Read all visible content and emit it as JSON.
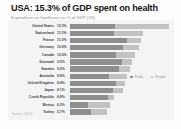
{
  "header": {
    "title": "USA: 15.3% of GDP spent on health",
    "subtitle": "Expenditure on healthcare as % of GDP ('06)"
  },
  "source": "Source: OECD",
  "legend": {
    "public_label": "Public",
    "private_label": "Private",
    "public_color": "#8e8e8e",
    "private_color": "#c2c2c2"
  },
  "chart_data": {
    "type": "bar",
    "title": "USA: 15.3% of GDP spent on health",
    "subtitle": "Expenditure on healthcare as % of GDP ('06)",
    "xlabel": "",
    "ylabel": "",
    "orientation": "horizontal",
    "stacked": true,
    "grid": false,
    "legend_position": "center-right",
    "xlim": [
      0,
      16
    ],
    "categories": [
      "United States",
      "Switzerland",
      "France",
      "Germany",
      "Canada",
      "Denmark",
      "Sweden",
      "Australia",
      "United Kingdom",
      "Japan",
      "Czech Republic",
      "Mexico",
      "Turkey"
    ],
    "value_labels": [
      "15.3%",
      "11.3%",
      "11.0%",
      "10.6%",
      "10.0%",
      "9.5%",
      "9.2%",
      "8.8%",
      "8.4%",
      "8.1%",
      "6.8%",
      "6.2%",
      "5.7%"
    ],
    "values": [
      15.3,
      11.3,
      11.0,
      10.6,
      10.0,
      9.5,
      9.2,
      8.8,
      8.4,
      8.1,
      6.8,
      6.2,
      5.7
    ],
    "series": [
      {
        "name": "Public",
        "color": "#8e8e8e",
        "values": [
          6.9,
          6.8,
          8.7,
          8.1,
          7.0,
          8.0,
          7.5,
          6.0,
          7.1,
          6.6,
          5.8,
          2.8,
          3.2
        ]
      },
      {
        "name": "Private",
        "color": "#c2c2c2",
        "values": [
          8.4,
          4.5,
          2.3,
          2.5,
          3.0,
          1.5,
          1.7,
          2.8,
          1.3,
          1.5,
          1.0,
          3.4,
          2.5
        ]
      }
    ]
  }
}
